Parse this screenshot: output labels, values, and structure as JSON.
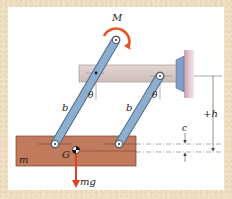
{
  "diagram": {
    "type": "mechanism",
    "labels": {
      "moment": "M",
      "link_left": "b",
      "link_right": "b",
      "angle_left": "θ",
      "angle_right": "θ",
      "mass": "m",
      "center_of_gravity": "G",
      "weight": "mg",
      "height_dim": "+h",
      "offset_dim": "c"
    },
    "colors": {
      "background_border": "#f1e2c6",
      "panel": "#ffffff",
      "fixed_bar": "#d7c9c6",
      "fixed_bar_edge": "#9a8e8c",
      "wall": "#d9b7c0",
      "bracket": "#7f9fc8",
      "link": "#8eaed0",
      "link_edge": "#4a6a8c",
      "block": "#c17a5c",
      "block_edge": "#7a4530",
      "arrow": "#e2401c",
      "moment_arrow": "#e8552a",
      "dim_line": "#444444"
    }
  }
}
